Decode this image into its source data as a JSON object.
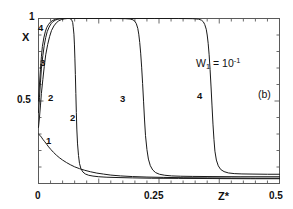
{
  "chart_data": {
    "type": "line",
    "title": "",
    "subtitle": "",
    "xlabel": "Z*",
    "ylabel": "X",
    "xlim": [
      0,
      0.5
    ],
    "ylim": [
      0,
      1
    ],
    "xticks": [
      0,
      0.25,
      0.5
    ],
    "xticklabels": [
      "0",
      "0.25",
      "0.5"
    ],
    "yticks": [
      0,
      0.5,
      1
    ],
    "yticklabels": [
      "0",
      "0.5",
      "1"
    ],
    "grid": false,
    "legend": "none",
    "annotations": [
      {
        "name": "parameter-annotation",
        "text": "W1 = 10^-1",
        "base": "W",
        "sub": "1",
        "mid": " = 10",
        "sup": "-1",
        "x": 0.32,
        "y": 0.78
      },
      {
        "name": "panel-label",
        "text": "(b)",
        "x": 0.455,
        "y": 0.555
      }
    ],
    "series": [
      {
        "name": "1",
        "label": "1",
        "color": "#1a1a1a",
        "label_positions": [
          {
            "x": 0.022,
            "y": 0.295
          }
        ],
        "points": [
          [
            0.0,
            0.3
          ],
          [
            0.003,
            0.292
          ],
          [
            0.006,
            0.281
          ],
          [
            0.009,
            0.268
          ],
          [
            0.013,
            0.253
          ],
          [
            0.017,
            0.238
          ],
          [
            0.021,
            0.222
          ],
          [
            0.026,
            0.205
          ],
          [
            0.031,
            0.189
          ],
          [
            0.037,
            0.172
          ],
          [
            0.043,
            0.157
          ],
          [
            0.05,
            0.142
          ],
          [
            0.058,
            0.127
          ],
          [
            0.066,
            0.114
          ],
          [
            0.075,
            0.101
          ],
          [
            0.085,
            0.09
          ],
          [
            0.096,
            0.08
          ],
          [
            0.108,
            0.071
          ],
          [
            0.121,
            0.063
          ],
          [
            0.135,
            0.057
          ],
          [
            0.15,
            0.051
          ],
          [
            0.17,
            0.046
          ],
          [
            0.195,
            0.042
          ],
          [
            0.225,
            0.039
          ],
          [
            0.26,
            0.037
          ],
          [
            0.3,
            0.035
          ],
          [
            0.35,
            0.034
          ],
          [
            0.4,
            0.033
          ],
          [
            0.45,
            0.032
          ],
          [
            0.5,
            0.032
          ]
        ]
      },
      {
        "name": "2",
        "label": "2",
        "color": "#1a1a1a",
        "label_positions": [
          {
            "x": 0.03,
            "y": 0.505
          },
          {
            "x": 0.072,
            "y": 0.385
          }
        ],
        "points": [
          [
            0.0,
            0.34
          ],
          [
            0.002,
            0.4
          ],
          [
            0.004,
            0.47
          ],
          [
            0.006,
            0.545
          ],
          [
            0.009,
            0.63
          ],
          [
            0.012,
            0.71
          ],
          [
            0.015,
            0.78
          ],
          [
            0.019,
            0.842
          ],
          [
            0.023,
            0.89
          ],
          [
            0.027,
            0.927
          ],
          [
            0.032,
            0.955
          ],
          [
            0.037,
            0.974
          ],
          [
            0.042,
            0.986
          ],
          [
            0.048,
            0.994
          ],
          [
            0.054,
            0.998
          ],
          [
            0.06,
            1.0
          ],
          [
            0.064,
            1.0
          ],
          [
            0.067,
            0.997
          ],
          [
            0.069,
            0.99
          ],
          [
            0.071,
            0.975
          ],
          [
            0.072,
            0.95
          ],
          [
            0.0735,
            0.905
          ],
          [
            0.0745,
            0.845
          ],
          [
            0.0755,
            0.76
          ],
          [
            0.0765,
            0.66
          ],
          [
            0.0775,
            0.545
          ],
          [
            0.0785,
            0.43
          ],
          [
            0.0795,
            0.33
          ],
          [
            0.081,
            0.24
          ],
          [
            0.083,
            0.17
          ],
          [
            0.085,
            0.122
          ],
          [
            0.088,
            0.09
          ],
          [
            0.092,
            0.07
          ],
          [
            0.097,
            0.058
          ],
          [
            0.104,
            0.05
          ],
          [
            0.113,
            0.045
          ],
          [
            0.125,
            0.041
          ],
          [
            0.142,
            0.038
          ],
          [
            0.165,
            0.036
          ],
          [
            0.195,
            0.034
          ],
          [
            0.235,
            0.032
          ],
          [
            0.29,
            0.031
          ],
          [
            0.36,
            0.03
          ],
          [
            0.44,
            0.029
          ],
          [
            0.5,
            0.029
          ]
        ]
      },
      {
        "name": "3",
        "label": "3",
        "color": "#1a1a1a",
        "label_positions": [
          {
            "x": 0.018,
            "y": 0.715
          },
          {
            "x": 0.192,
            "y": 0.505
          }
        ],
        "points": [
          [
            0.0,
            0.43
          ],
          [
            0.002,
            0.52
          ],
          [
            0.004,
            0.61
          ],
          [
            0.006,
            0.695
          ],
          [
            0.009,
            0.775
          ],
          [
            0.012,
            0.838
          ],
          [
            0.015,
            0.885
          ],
          [
            0.018,
            0.92
          ],
          [
            0.022,
            0.948
          ],
          [
            0.026,
            0.968
          ],
          [
            0.03,
            0.981
          ],
          [
            0.035,
            0.99
          ],
          [
            0.04,
            0.996
          ],
          [
            0.046,
            0.999
          ],
          [
            0.052,
            1.0
          ],
          [
            0.07,
            1.0
          ],
          [
            0.1,
            1.0
          ],
          [
            0.13,
            1.0
          ],
          [
            0.16,
            1.0
          ],
          [
            0.18,
            0.999
          ],
          [
            0.19,
            0.997
          ],
          [
            0.196,
            0.992
          ],
          [
            0.2,
            0.983
          ],
          [
            0.203,
            0.968
          ],
          [
            0.206,
            0.94
          ],
          [
            0.208,
            0.905
          ],
          [
            0.21,
            0.855
          ],
          [
            0.212,
            0.79
          ],
          [
            0.214,
            0.705
          ],
          [
            0.216,
            0.605
          ],
          [
            0.218,
            0.495
          ],
          [
            0.22,
            0.385
          ],
          [
            0.222,
            0.29
          ],
          [
            0.225,
            0.205
          ],
          [
            0.228,
            0.148
          ],
          [
            0.232,
            0.108
          ],
          [
            0.237,
            0.082
          ],
          [
            0.243,
            0.066
          ],
          [
            0.251,
            0.056
          ],
          [
            0.262,
            0.05
          ],
          [
            0.276,
            0.046
          ],
          [
            0.295,
            0.044
          ],
          [
            0.32,
            0.043
          ],
          [
            0.36,
            0.042
          ],
          [
            0.42,
            0.041
          ],
          [
            0.5,
            0.041
          ]
        ]
      },
      {
        "name": "4",
        "label": "4",
        "color": "#1a1a1a",
        "label_positions": [
          {
            "x": 0.008,
            "y": 0.945
          },
          {
            "x": 0.33,
            "y": 0.535
          }
        ],
        "points": [
          [
            0.0,
            0.5
          ],
          [
            0.002,
            0.6
          ],
          [
            0.004,
            0.69
          ],
          [
            0.006,
            0.768
          ],
          [
            0.008,
            0.83
          ],
          [
            0.011,
            0.882
          ],
          [
            0.014,
            0.919
          ],
          [
            0.017,
            0.945
          ],
          [
            0.021,
            0.965
          ],
          [
            0.025,
            0.979
          ],
          [
            0.03,
            0.989
          ],
          [
            0.035,
            0.995
          ],
          [
            0.041,
            0.998
          ],
          [
            0.048,
            1.0
          ],
          [
            0.07,
            1.0
          ],
          [
            0.12,
            1.0
          ],
          [
            0.18,
            1.0
          ],
          [
            0.24,
            1.0
          ],
          [
            0.29,
            1.0
          ],
          [
            0.32,
            0.999
          ],
          [
            0.332,
            0.996
          ],
          [
            0.338,
            0.99
          ],
          [
            0.342,
            0.98
          ],
          [
            0.345,
            0.963
          ],
          [
            0.348,
            0.935
          ],
          [
            0.35,
            0.9
          ],
          [
            0.352,
            0.85
          ],
          [
            0.354,
            0.78
          ],
          [
            0.356,
            0.69
          ],
          [
            0.358,
            0.585
          ],
          [
            0.36,
            0.47
          ],
          [
            0.362,
            0.36
          ],
          [
            0.364,
            0.268
          ],
          [
            0.366,
            0.196
          ],
          [
            0.369,
            0.142
          ],
          [
            0.373,
            0.107
          ],
          [
            0.378,
            0.085
          ],
          [
            0.385,
            0.072
          ],
          [
            0.394,
            0.064
          ],
          [
            0.406,
            0.06
          ],
          [
            0.422,
            0.058
          ],
          [
            0.445,
            0.057
          ],
          [
            0.475,
            0.056
          ],
          [
            0.5,
            0.056
          ]
        ]
      }
    ]
  },
  "axes": {
    "ylabel": "X",
    "xlabel": "Z*",
    "y_top": "1",
    "y_mid": "0.5",
    "x_left": "0",
    "x_mid": "0.25",
    "x_right": "0.5"
  },
  "annotations": {
    "w1_base": "W",
    "w1_sub": "1",
    "w1_mid": " = 10",
    "w1_sup": "-1",
    "panel": "(b)"
  },
  "curve_labels": {
    "c4_left": "4",
    "c3_left": "3",
    "c2_left": "2",
    "c1_left": "1",
    "c2_right": "2",
    "c3_right": "3",
    "c4_right": "4"
  }
}
